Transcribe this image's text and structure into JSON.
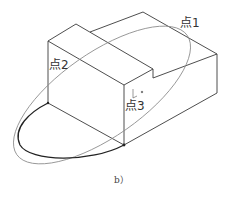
{
  "figure": {
    "caption": "b）",
    "labels": {
      "point1": "点1",
      "point2": "点2",
      "point3": "点3"
    },
    "colors": {
      "edge": "#3a3a3a",
      "ellipse": "#8a8a8a",
      "arc": "#222222"
    }
  }
}
